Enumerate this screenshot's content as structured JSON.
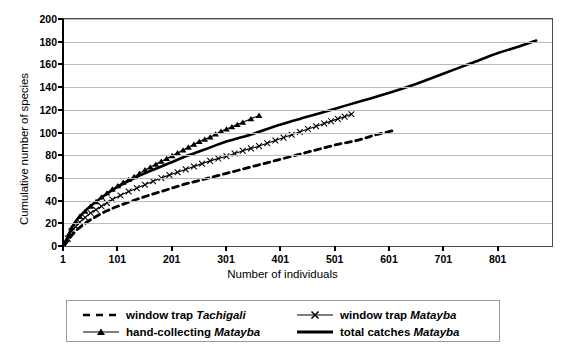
{
  "chart_data": {
    "type": "line",
    "title": "",
    "xlabel": "Number of individuals",
    "ylabel": "Cumulative number of species",
    "xlim": [
      1,
      901
    ],
    "ylim": [
      0,
      200
    ],
    "xticks": [
      "1",
      "101",
      "201",
      "301",
      "401",
      "501",
      "601",
      "701",
      "801"
    ],
    "xtick_values": [
      1,
      101,
      201,
      301,
      401,
      501,
      601,
      701,
      801
    ],
    "yticks": [
      "0",
      "20",
      "40",
      "60",
      "80",
      "100",
      "120",
      "140",
      "160",
      "180",
      "200"
    ],
    "ytick_values": [
      0,
      20,
      40,
      60,
      80,
      100,
      120,
      140,
      160,
      180,
      200
    ],
    "grid": "horizontal",
    "legend_position": "bottom",
    "series": [
      {
        "name": "window trap Tachigali",
        "name_plain": "window trap ",
        "name_italic": "Tachigali",
        "style": "dashed",
        "marker": "none",
        "color": "#000000",
        "points": [
          [
            1,
            0
          ],
          [
            20,
            12
          ],
          [
            40,
            20
          ],
          [
            60,
            26
          ],
          [
            80,
            31
          ],
          [
            100,
            35
          ],
          [
            140,
            42
          ],
          [
            180,
            48
          ],
          [
            220,
            54
          ],
          [
            260,
            59
          ],
          [
            300,
            64
          ],
          [
            340,
            69
          ],
          [
            380,
            74
          ],
          [
            420,
            79
          ],
          [
            460,
            84
          ],
          [
            500,
            89
          ],
          [
            540,
            93
          ],
          [
            575,
            98
          ],
          [
            610,
            102
          ]
        ]
      },
      {
        "name": "hand-collecting Matayba",
        "name_plain": "hand-collecting ",
        "name_italic": "Matayba",
        "style": "solid-thin",
        "marker": "triangle",
        "color": "#000000",
        "points": [
          [
            1,
            0
          ],
          [
            15,
            16
          ],
          [
            30,
            26
          ],
          [
            50,
            35
          ],
          [
            70,
            43
          ],
          [
            90,
            50
          ],
          [
            110,
            56
          ],
          [
            130,
            61
          ],
          [
            150,
            67
          ],
          [
            170,
            72
          ],
          [
            190,
            77
          ],
          [
            210,
            82
          ],
          [
            230,
            87
          ],
          [
            250,
            92
          ],
          [
            270,
            96
          ],
          [
            290,
            101
          ],
          [
            310,
            105
          ],
          [
            330,
            109
          ],
          [
            345,
            112
          ],
          [
            360,
            115
          ]
        ]
      },
      {
        "name": "window trap Matayba",
        "name_plain": "window trap ",
        "name_italic": "Matayba",
        "style": "solid-thin",
        "marker": "x",
        "color": "#000000",
        "points": [
          [
            1,
            0
          ],
          [
            15,
            13
          ],
          [
            30,
            21
          ],
          [
            50,
            29
          ],
          [
            70,
            35
          ],
          [
            90,
            41
          ],
          [
            120,
            48
          ],
          [
            150,
            54
          ],
          [
            180,
            60
          ],
          [
            210,
            65
          ],
          [
            240,
            70
          ],
          [
            270,
            75
          ],
          [
            300,
            79
          ],
          [
            330,
            84
          ],
          [
            360,
            88
          ],
          [
            390,
            93
          ],
          [
            420,
            98
          ],
          [
            450,
            103
          ],
          [
            480,
            108
          ],
          [
            505,
            112
          ],
          [
            530,
            116
          ]
        ]
      },
      {
        "name": "total catches Matayba",
        "name_plain": "total catches ",
        "name_italic": "Matayba",
        "style": "solid-thick",
        "marker": "none",
        "color": "#000000",
        "points": [
          [
            1,
            0
          ],
          [
            20,
            20
          ],
          [
            40,
            31
          ],
          [
            60,
            39
          ],
          [
            80,
            46
          ],
          [
            100,
            52
          ],
          [
            140,
            62
          ],
          [
            180,
            70
          ],
          [
            220,
            78
          ],
          [
            260,
            85
          ],
          [
            300,
            92
          ],
          [
            350,
            99
          ],
          [
            400,
            107
          ],
          [
            450,
            114
          ],
          [
            500,
            121
          ],
          [
            550,
            128
          ],
          [
            600,
            135
          ],
          [
            650,
            143
          ],
          [
            700,
            152
          ],
          [
            750,
            161
          ],
          [
            800,
            170
          ],
          [
            840,
            176
          ],
          [
            870,
            181
          ]
        ]
      }
    ]
  },
  "legend": {
    "entries": [
      {
        "plain": "window trap ",
        "italic": "Tachigali"
      },
      {
        "plain": "window trap ",
        "italic": "Matayba"
      },
      {
        "plain": "hand-collecting ",
        "italic": "Matayba"
      },
      {
        "plain": "total catches ",
        "italic": "Matayba"
      }
    ]
  }
}
